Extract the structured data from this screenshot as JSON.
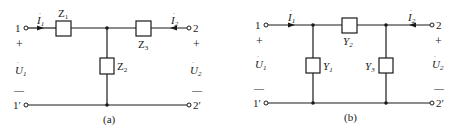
{
  "figure": {
    "panels": [
      {
        "caption": "(a)",
        "type": "T-network",
        "ports": {
          "p1_top": "1",
          "p1_bottom": "1′",
          "p2_top": "2",
          "p2_bottom": "2′"
        },
        "voltages": {
          "u1": "U",
          "u1_sub": "1",
          "u2": "U",
          "u2_sub": "2",
          "plus": "+",
          "minus": "—"
        },
        "currents": {
          "i1": "I",
          "i1_sub": "1",
          "i2": "I",
          "i2_sub": "2"
        },
        "elements": [
          {
            "name": "Z",
            "sub": "1",
            "position": "series-left"
          },
          {
            "name": "Z",
            "sub": "2",
            "position": "shunt"
          },
          {
            "name": "Z",
            "sub": "3",
            "position": "series-right"
          }
        ]
      },
      {
        "caption": "(b)",
        "type": "Pi-network",
        "ports": {
          "p1_top": "1",
          "p1_bottom": "1′",
          "p2_top": "2",
          "p2_bottom": "2′"
        },
        "voltages": {
          "u1": "U",
          "u1_sub": "1",
          "u2": "U",
          "u2_sub": "2",
          "plus": "+",
          "minus": "—"
        },
        "currents": {
          "i1": "I",
          "i1_sub": "1",
          "i2": "I",
          "i2_sub": "2"
        },
        "elements": [
          {
            "name": "Y",
            "sub": "1",
            "position": "shunt-left"
          },
          {
            "name": "Y",
            "sub": "2",
            "position": "series"
          },
          {
            "name": "Y",
            "sub": "3",
            "position": "shunt-right"
          }
        ]
      }
    ]
  }
}
